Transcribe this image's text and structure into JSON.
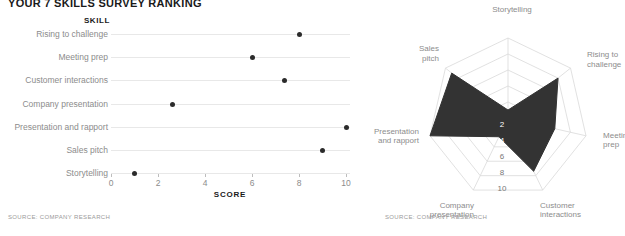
{
  "headline": "YOUR 7 SKILLS SURVEY RANKING",
  "dot_chart": {
    "column_header": "SKILL",
    "axis_title": "SCORE",
    "source": "SOURCE: COMPANY RESEARCH",
    "x_ticks": [
      "0",
      "2",
      "4",
      "6",
      "8",
      "10"
    ]
  },
  "radar_chart": {
    "source": "SOURCE: COMPANY RESEARCH",
    "radial_ticks": [
      "2",
      "4",
      "6",
      "8",
      "10"
    ],
    "axis_labels": [
      "Storytelling",
      "Rising to\nchallenge",
      "Meeting\nprep",
      "Customer\ninteractions",
      "Company\npresentation",
      "Presentation\nand rapport",
      "Sales\npitch"
    ]
  },
  "chart_data": [
    {
      "type": "scatter",
      "title": "YOUR 7 SKILLS SURVEY RANKING",
      "xlabel": "SCORE",
      "ylabel": "SKILL",
      "xlim": [
        0,
        10
      ],
      "xticks": [
        0,
        2,
        4,
        6,
        8,
        10
      ],
      "grid": true,
      "categories": [
        "Rising to challenge",
        "Meeting prep",
        "Customer interactions",
        "Company presentation",
        "Presentation and rapport",
        "Sales pitch",
        "Storytelling"
      ],
      "values": [
        8,
        6,
        7.4,
        2.6,
        10,
        9,
        1
      ]
    },
    {
      "type": "radar",
      "title": "",
      "rlim": [
        0,
        10
      ],
      "rticks": [
        2,
        4,
        6,
        8,
        10
      ],
      "inverted_radial_axis": true,
      "grid": true,
      "categories": [
        "Storytelling",
        "Rising to challenge",
        "Meeting prep",
        "Customer interactions",
        "Company presentation",
        "Presentation and rapport",
        "Sales pitch"
      ],
      "values": [
        1,
        8,
        6,
        7.4,
        2.6,
        10,
        9
      ],
      "fill_color": "#333333"
    }
  ],
  "colors": {
    "dot": "#2b2b2b",
    "grid": "#e8e8e8",
    "label": "#8c8c8c",
    "radar_fill": "#333333",
    "radar_grid": "#d9d9d9"
  }
}
